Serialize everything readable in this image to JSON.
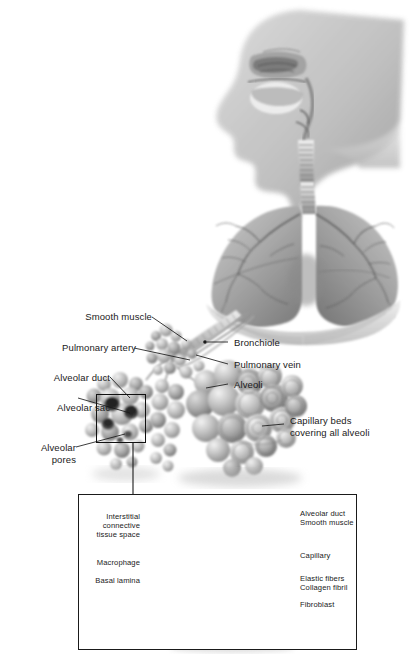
{
  "figure": {
    "background": "#ffffff",
    "line_color": "#1a1a1a"
  },
  "panels": {
    "upper": {
      "name": "head-neck-sagittal-and-lungs",
      "description": "Sagittal section of head and neck showing nasal cavity, oral cavity, pharynx, larynx and trachea, continuing to a pair of lungs with bronchial tree and diaphragm",
      "labels": []
    },
    "middle": {
      "name": "alveolar-cluster",
      "description": "Terminal bronchiole with pulmonary artery and vein leading to grape-like clusters of alveoli covered by capillary beds",
      "labels_left": [
        {
          "id": "smooth-muscle",
          "text": "Smooth muscle"
        },
        {
          "id": "pulmonary-artery",
          "text": "Pulmonary artery"
        },
        {
          "id": "alveolar-duct",
          "text": "Alveolar duct"
        },
        {
          "id": "alveolar-sac",
          "text": "Alveolar sac"
        },
        {
          "id": "alveolar-pores",
          "text": "Alveolar\npores"
        }
      ],
      "labels_right": [
        {
          "id": "bronchiole",
          "text": "Bronchiole"
        },
        {
          "id": "pulmonary-vein",
          "text": "Pulmonary vein"
        },
        {
          "id": "alveoli",
          "text": "Alveoli"
        },
        {
          "id": "capillary-beds",
          "text": "Capillary beds\ncovering all alveoli"
        }
      ]
    },
    "inset": {
      "name": "alveolar-sac-cutaway",
      "description": "Magnified cut-away of a single alveolar sac showing interior septa, capillary network and connective tissue elements",
      "labels_left": [
        {
          "id": "interstitial-connective-tissue-space",
          "text": "Interstitial\nconnective\ntissue space"
        },
        {
          "id": "macrophage",
          "text": "Macrophage"
        },
        {
          "id": "basal-lamina",
          "text": "Basal lamina"
        }
      ],
      "labels_right": [
        {
          "id": "alveolar-duct",
          "text": "Alveolar duct"
        },
        {
          "id": "smooth-muscle",
          "text": "Smooth muscle"
        },
        {
          "id": "capillary",
          "text": "Capillary"
        },
        {
          "id": "elastic-fibers",
          "text": "Elastic fibers"
        },
        {
          "id": "collagen-fibril",
          "text": "Collagen fibril"
        },
        {
          "id": "fibroblast",
          "text": "Fibroblast"
        }
      ]
    }
  }
}
